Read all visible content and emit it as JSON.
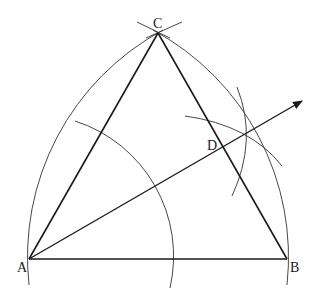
{
  "diagram": {
    "points": {
      "A": {
        "label": "A",
        "x": 29,
        "y": 259
      },
      "B": {
        "label": "B",
        "x": 287,
        "y": 259
      },
      "C": {
        "label": "C",
        "x": 158,
        "y": 33
      },
      "D": {
        "label": "D",
        "x": 222,
        "y": 145
      }
    },
    "colors": {
      "line": "#1a1a1a",
      "arc": "#333333",
      "background": "#ffffff"
    }
  }
}
